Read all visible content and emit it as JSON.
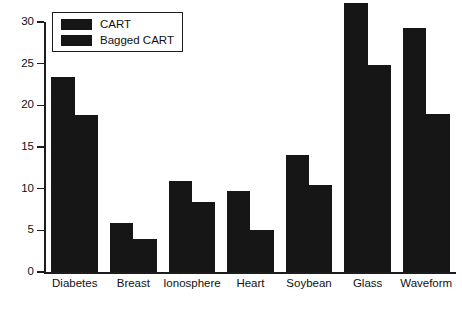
{
  "chart_data": {
    "type": "bar",
    "title": "",
    "subtitle": "",
    "xlabel": "",
    "ylabel": "",
    "ylim": [
      0,
      30
    ],
    "yticks": [
      0,
      5,
      10,
      15,
      20,
      25,
      30
    ],
    "ytick_labels": [
      "0",
      "5",
      "10",
      "15",
      "20",
      "25",
      "30"
    ],
    "grid": false,
    "legend_position": "top-left",
    "categories": [
      "Diabetes",
      "Breast",
      "Ionosphere",
      "Heart",
      "Soybean",
      "Glass",
      "Waveform"
    ],
    "series": [
      {
        "name": "CART",
        "color": "#161616",
        "values": [
          23.4,
          5.9,
          10.9,
          9.7,
          14.1,
          32.3,
          29.3
        ]
      },
      {
        "name": "Bagged CART",
        "color": "#161616",
        "values": [
          18.8,
          4.0,
          8.4,
          5.0,
          10.4,
          24.8,
          19.0
        ]
      }
    ]
  },
  "legend": {
    "entries": [
      {
        "label": "CART"
      },
      {
        "label": "Bagged CART"
      }
    ]
  },
  "colors": {
    "bar": "#161616",
    "axis": "#1c1c1c",
    "text": "#111111",
    "background": "#ffffff"
  }
}
